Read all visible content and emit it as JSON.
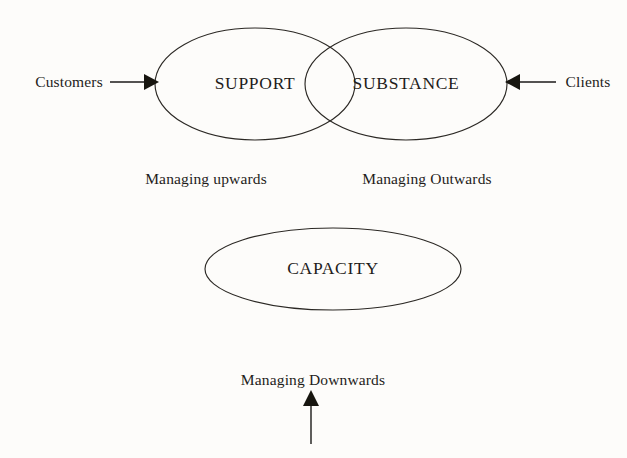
{
  "diagram": {
    "background_color": "#fdfcfa",
    "stroke_color": "#2b2824",
    "text_color": "#1f1d1a",
    "ellipses": [
      {
        "id": "support",
        "label": "SUPPORT",
        "cx": 255,
        "cy": 84,
        "rx": 100,
        "ry": 56
      },
      {
        "id": "substance",
        "label": "SUBSTANCE",
        "cx": 406,
        "cy": 84,
        "rx": 101,
        "ry": 56
      },
      {
        "id": "capacity",
        "label": "CAPACITY",
        "cx": 333,
        "cy": 269,
        "rx": 128,
        "ry": 41
      }
    ],
    "labels": {
      "support": "SUPPORT",
      "substance": "SUBSTANCE",
      "capacity": "CAPACITY"
    },
    "inputs": {
      "left": "Customers",
      "right": "Clients"
    },
    "captions": {
      "managing_upwards": "Managing upwards",
      "managing_outwards": "Managing Outwards",
      "managing_downwards": "Managing Downwards"
    },
    "arrows": [
      {
        "id": "customers-arrow",
        "direction": "right",
        "from_label": "Customers"
      },
      {
        "id": "clients-arrow",
        "direction": "left",
        "from_label": "Clients"
      },
      {
        "id": "downwards-arrow",
        "direction": "up",
        "from_label": "Managing Downwards"
      }
    ]
  }
}
